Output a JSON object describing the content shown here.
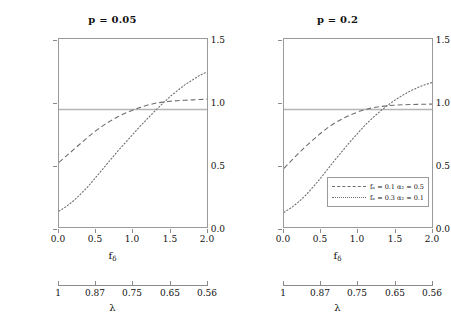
{
  "figure": {
    "panels": [
      {
        "title": "p = 0.05",
        "id": "p005"
      },
      {
        "title": "p = 0.2",
        "id": "p02"
      }
    ],
    "axes": {
      "ylabel": "Relative Efficiency",
      "yticks": [
        "0.0",
        "0.5",
        "1.0",
        "1.5"
      ],
      "xlabel_main": "f",
      "xlabel_sub": "δ",
      "xticks": [
        "0.0",
        "0.5",
        "1.0",
        "1.5",
        "2.0"
      ],
      "lambda_label": "λ",
      "lambda_ticks": [
        "1",
        "0.87",
        "0.75",
        "0.65",
        "0.56"
      ]
    },
    "legend": {
      "entries": [
        {
          "style": "dashed",
          "label": "fₙ = 0.1 α₂ = 0.5"
        },
        {
          "style": "dotted",
          "label": "fₙ = 0.3 α₂ = 0.1"
        }
      ]
    },
    "colors": {
      "curve": "#6e6e6e",
      "reference_line": "#b5b5b5",
      "frame": "#9a9a9a",
      "text": "#111111"
    }
  },
  "chart_data": {
    "type": "line",
    "xlabel": "f_δ",
    "ylabel": "Relative Efficiency",
    "xlim": [
      0.0,
      2.0
    ],
    "ylim": [
      0.0,
      1.6
    ],
    "grid": false,
    "legend_position": "bottom-right of right panel",
    "secondary_x_axis": {
      "label": "λ",
      "tick_labels": [
        "1",
        "0.87",
        "0.75",
        "0.65",
        "0.56"
      ],
      "tick_x_values": [
        0.0,
        0.5,
        1.0,
        1.5,
        2.0
      ]
    },
    "reference_lines": [
      {
        "orientation": "horizontal",
        "y": 1.0,
        "style": "solid",
        "color": "#b5b5b5"
      }
    ],
    "panels": [
      {
        "panel_title": "p = 0.05",
        "x": [
          0.0,
          0.1,
          0.2,
          0.3,
          0.4,
          0.5,
          0.6,
          0.7,
          0.8,
          0.9,
          1.0,
          1.1,
          1.2,
          1.3,
          1.4,
          1.5,
          1.6,
          1.7,
          1.8,
          1.9,
          2.0
        ],
        "series": [
          {
            "name": "f_N = 0.1 a_2 = 0.5",
            "style": "dashed",
            "values": [
              0.55,
              0.605,
              0.66,
              0.715,
              0.77,
              0.82,
              0.865,
              0.905,
              0.94,
              0.97,
              0.995,
              1.018,
              1.038,
              1.053,
              1.063,
              1.07,
              1.075,
              1.079,
              1.082,
              1.085,
              1.088
            ]
          },
          {
            "name": "f_N = 0.3 a_2 = 0.1",
            "style": "dotted",
            "values": [
              0.135,
              0.175,
              0.225,
              0.285,
              0.35,
              0.425,
              0.5,
              0.575,
              0.65,
              0.72,
              0.79,
              0.86,
              0.925,
              0.99,
              1.05,
              1.11,
              1.16,
              1.21,
              1.25,
              1.29,
              1.32
            ]
          }
        ]
      },
      {
        "panel_title": "p = 0.2",
        "x": [
          0.0,
          0.1,
          0.2,
          0.3,
          0.4,
          0.5,
          0.6,
          0.7,
          0.8,
          0.9,
          1.0,
          1.1,
          1.2,
          1.3,
          1.4,
          1.5,
          1.6,
          1.7,
          1.8,
          1.9,
          2.0
        ],
        "series": [
          {
            "name": "f_N = 0.1 a_2 = 0.5",
            "style": "dashed",
            "values": [
              0.5,
              0.565,
              0.63,
              0.69,
              0.745,
              0.8,
              0.85,
              0.89,
              0.925,
              0.955,
              0.98,
              1.0,
              1.015,
              1.025,
              1.032,
              1.037,
              1.04,
              1.042,
              1.044,
              1.045,
              1.046
            ]
          },
          {
            "name": "f_N = 0.3 a_2 = 0.1",
            "style": "dotted",
            "values": [
              0.125,
              0.165,
              0.215,
              0.275,
              0.345,
              0.42,
              0.5,
              0.58,
              0.655,
              0.73,
              0.8,
              0.87,
              0.93,
              0.985,
              1.035,
              1.08,
              1.12,
              1.155,
              1.185,
              1.21,
              1.23
            ]
          }
        ]
      }
    ]
  }
}
